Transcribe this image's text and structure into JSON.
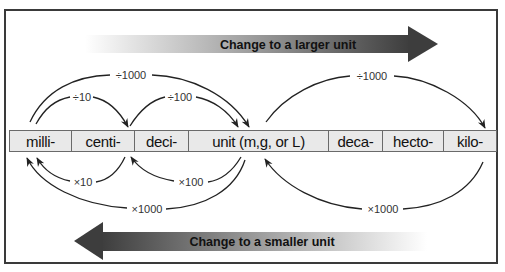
{
  "diagram": {
    "top_arrow": {
      "label": "Change to a larger unit",
      "direction": "right"
    },
    "bottom_arrow": {
      "label": "Change to a smaller unit",
      "direction": "left"
    },
    "units": [
      {
        "label": "milli-",
        "width": 62
      },
      {
        "label": "centi-",
        "width": 63
      },
      {
        "label": "deci-",
        "width": 54
      },
      {
        "label": "unit (m,g, or L)",
        "width": 140
      },
      {
        "label": "deca-",
        "width": 54
      },
      {
        "label": "hecto-",
        "width": 61
      },
      {
        "label": "kilo-",
        "width": 54
      }
    ],
    "conversions_up": [
      {
        "from": "milli-",
        "to": "centi-",
        "label": "÷10"
      },
      {
        "from": "centi-",
        "to": "unit (m,g, or L)",
        "label": "÷100"
      },
      {
        "from": "milli-",
        "to": "unit (m,g, or L)",
        "label": "÷1000"
      },
      {
        "from": "unit (m,g, or L)",
        "to": "kilo-",
        "label": "÷1000"
      }
    ],
    "conversions_down": [
      {
        "from": "centi-",
        "to": "milli-",
        "label": "×10"
      },
      {
        "from": "unit (m,g, or L)",
        "to": "centi-",
        "label": "×100"
      },
      {
        "from": "unit (m,g, or L)",
        "to": "milli-",
        "label": "×1000"
      },
      {
        "from": "kilo-",
        "to": "unit (m,g, or L)",
        "label": "×1000"
      }
    ],
    "colors": {
      "arrow_dark": "#3d3d3d",
      "arrow_light": "#ffffff",
      "unit_bar_bg": "#e9e9e9",
      "frame_border": "#3a3a3a",
      "curve_stroke": "#222222"
    }
  }
}
